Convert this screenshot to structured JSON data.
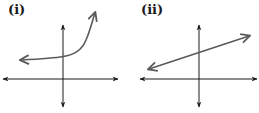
{
  "panels": [
    {
      "label": "(i)",
      "description": "Exponential-growth curve with horizontal asymptote above the x-axis",
      "type": "exponential",
      "stroke_color": "#5a5a5a"
    },
    {
      "label": "(ii)",
      "description": "Straight line with positive slope and positive y-intercept",
      "type": "linear",
      "stroke_color": "#5a5a5a"
    }
  ],
  "axis_color": "#1a1a1a"
}
